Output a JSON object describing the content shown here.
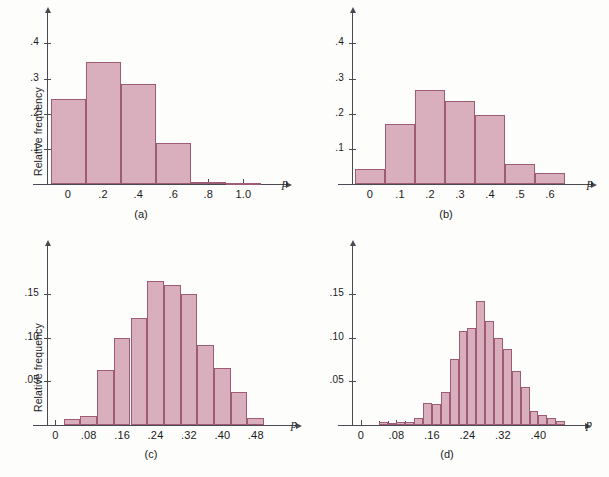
{
  "figure": {
    "background": "#fdfdfc",
    "bar_fill": "#d9aebd",
    "bar_stroke": "#9e5b75",
    "axis_color": "#4a4a52"
  },
  "panels": [
    {
      "id": "a",
      "caption": "(a)",
      "ylabel": "Relative frequency",
      "xlabel": "p",
      "chart_data": {
        "type": "bar",
        "title": "",
        "xlabel": "p",
        "ylabel": "Relative frequency",
        "ylim": [
          0,
          0.47
        ],
        "xlim": [
          -0.12,
          1.18
        ],
        "grid": false,
        "legend": "none",
        "bin_width": 0.2,
        "bin_starts": [
          -0.1,
          0.1,
          0.3,
          0.5,
          0.7,
          0.9
        ],
        "categories": [
          "-0.1–0.1",
          "0.1–0.3",
          "0.3–0.5",
          "0.5–0.7",
          "0.7–0.9",
          "0.9–1.1"
        ],
        "values": [
          0.243,
          0.347,
          0.285,
          0.117,
          0.007,
          0.003
        ],
        "ytick_values": [
          0.1,
          0.2,
          0.3,
          0.4
        ],
        "ytick_labels": [
          ".1",
          ".2",
          ".3",
          ".4"
        ],
        "xtick_values": [
          0,
          0.2,
          0.4,
          0.6,
          0.8,
          1.0
        ],
        "xtick_labels": [
          "0",
          ".2",
          ".4",
          ".6",
          ".8",
          "1.0"
        ]
      }
    },
    {
      "id": "b",
      "caption": "(b)",
      "ylabel": "",
      "xlabel": "p",
      "chart_data": {
        "type": "bar",
        "title": "",
        "xlabel": "p",
        "ylabel": "Relative frequency",
        "ylim": [
          0,
          0.47
        ],
        "xlim": [
          -0.06,
          0.7
        ],
        "grid": false,
        "legend": "none",
        "bin_width": 0.1,
        "bin_starts": [
          -0.05,
          0.05,
          0.15,
          0.25,
          0.35,
          0.45,
          0.55
        ],
        "categories": [
          "-0.05–0.05",
          "0.05–0.15",
          "0.15–0.25",
          "0.25–0.35",
          "0.35–0.45",
          "0.45–0.55",
          "0.55–0.65"
        ],
        "values": [
          0.044,
          0.172,
          0.266,
          0.235,
          0.197,
          0.057,
          0.03
        ],
        "ytick_values": [
          0.1,
          0.2,
          0.3,
          0.4
        ],
        "ytick_labels": [
          ".1",
          ".2",
          ".3",
          ".4"
        ],
        "xtick_values": [
          0,
          0.1,
          0.2,
          0.3,
          0.4,
          0.5,
          0.6
        ],
        "xtick_labels": [
          "0",
          ".1",
          ".2",
          ".3",
          ".4",
          ".5",
          ".6"
        ]
      }
    },
    {
      "id": "c",
      "caption": "(c)",
      "ylabel": "Relative frequency",
      "xlabel": "p",
      "chart_data": {
        "type": "bar",
        "title": "",
        "xlabel": "p",
        "ylabel": "Relative frequency",
        "ylim": [
          0,
          0.2
        ],
        "xlim": [
          -0.02,
          0.55
        ],
        "grid": false,
        "legend": "none",
        "bin_width": 0.04,
        "bin_starts": [
          0.02,
          0.06,
          0.1,
          0.14,
          0.18,
          0.22,
          0.26,
          0.3,
          0.34,
          0.38,
          0.42,
          0.46
        ],
        "categories": [
          "0.02–0.06",
          "0.06–0.10",
          "0.10–0.14",
          "0.14–0.18",
          "0.18–0.22",
          "0.22–0.26",
          "0.26–0.30",
          "0.30–0.34",
          "0.34–0.38",
          "0.38–0.42",
          "0.42–0.46",
          "0.46–0.50"
        ],
        "values": [
          0.007,
          0.01,
          0.063,
          0.1,
          0.123,
          0.166,
          0.161,
          0.15,
          0.092,
          0.066,
          0.038,
          0.008
        ],
        "ytick_values": [
          0.05,
          0.1,
          0.15
        ],
        "ytick_labels": [
          ".05",
          ".10",
          ".15"
        ],
        "xtick_values": [
          0,
          0.08,
          0.16,
          0.24,
          0.32,
          0.4,
          0.48
        ],
        "xtick_labels": [
          "0",
          ".08",
          ".16",
          ".24",
          ".32",
          ".40",
          ".48"
        ]
      }
    },
    {
      "id": "d",
      "caption": "(d)",
      "ylabel": "",
      "xlabel": "p",
      "chart_data": {
        "type": "bar",
        "title": "",
        "xlabel": "p",
        "ylabel": "Relative frequency",
        "ylim": [
          0,
          0.2
        ],
        "xlim": [
          -0.02,
          0.48
        ],
        "grid": false,
        "legend": "none",
        "bin_width": 0.02,
        "bin_starts": [
          0.04,
          0.06,
          0.08,
          0.1,
          0.12,
          0.14,
          0.16,
          0.18,
          0.2,
          0.22,
          0.24,
          0.26,
          0.28,
          0.3,
          0.32,
          0.34,
          0.36,
          0.38,
          0.4,
          0.42,
          0.44
        ],
        "categories": [
          "0.04–0.06",
          "0.06–0.08",
          "0.08–0.10",
          "0.10–0.12",
          "0.12–0.14",
          "0.14–0.16",
          "0.16–0.18",
          "0.18–0.20",
          "0.20–0.22",
          "0.22–0.24",
          "0.24–0.26",
          "0.26–0.28",
          "0.28–0.30",
          "0.30–0.32",
          "0.32–0.34",
          "0.34–0.36",
          "0.36–0.38",
          "0.38–0.40",
          "0.40–0.42",
          "0.42–0.44",
          "0.44–0.46"
        ],
        "values": [
          0.003,
          0.002,
          0.004,
          0.003,
          0.008,
          0.025,
          0.024,
          0.038,
          0.076,
          0.108,
          0.112,
          0.142,
          0.12,
          0.1,
          0.087,
          0.062,
          0.044,
          0.016,
          0.012,
          0.008,
          0.005
        ],
        "ytick_values": [
          0.05,
          0.1,
          0.15
        ],
        "ytick_labels": [
          ".05",
          ".10",
          ".15"
        ],
        "xtick_values": [
          0,
          0.08,
          0.16,
          0.24,
          0.32,
          0.4
        ],
        "xtick_labels": [
          "0",
          ".08",
          ".16",
          ".24",
          ".32",
          ".40"
        ]
      }
    }
  ]
}
